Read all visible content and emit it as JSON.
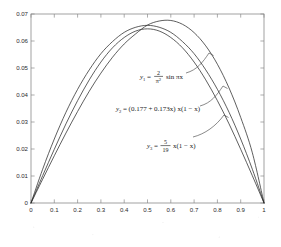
{
  "chart_data": {
    "type": "line",
    "title": "",
    "subtitle": "",
    "xlabel": "",
    "ylabel": "",
    "xlim": [
      0,
      1
    ],
    "ylim": [
      0,
      0.07
    ],
    "grid": false,
    "legend_position": "inline-annotations",
    "x_ticks": [
      "0",
      "0.1",
      "0.2",
      "0.3",
      "0.4",
      "0.5",
      "0.6",
      "0.7",
      "0.8",
      "0.9",
      "1"
    ],
    "x_tick_values": [
      0,
      0.1,
      0.2,
      0.3,
      0.4,
      0.5,
      0.6,
      0.7,
      0.8,
      0.9,
      1
    ],
    "y_ticks": [
      "0",
      "0.01",
      "0.02",
      "0.03",
      "0.04",
      "0.05",
      "0.06",
      "0.07"
    ],
    "y_tick_values": [
      0,
      0.01,
      0.02,
      0.03,
      0.04,
      0.05,
      0.06,
      0.07
    ],
    "series": [
      {
        "name": "y1",
        "formula": "y1 = (2/pi^2) sin(pi x)",
        "peak_x": 0.5,
        "peak_y": 0.0645,
        "x": [
          0,
          0.05,
          0.1,
          0.15,
          0.2,
          0.25,
          0.3,
          0.35,
          0.4,
          0.45,
          0.5,
          0.55,
          0.6,
          0.65,
          0.7,
          0.75,
          0.8,
          0.85,
          0.9,
          0.95,
          1
        ],
        "values": [
          0,
          0.0101,
          0.0199,
          0.0293,
          0.0379,
          0.0456,
          0.0522,
          0.0575,
          0.0613,
          0.0637,
          0.0645,
          0.0637,
          0.0613,
          0.0575,
          0.0522,
          0.0456,
          0.0379,
          0.0293,
          0.0199,
          0.0101,
          0
        ]
      },
      {
        "name": "y2",
        "formula": "y2 = (0.177 + 0.173x) x(1 - x)",
        "peak_x": 0.55,
        "peak_y": 0.0677,
        "x": [
          0,
          0.05,
          0.1,
          0.15,
          0.2,
          0.25,
          0.3,
          0.35,
          0.4,
          0.45,
          0.5,
          0.55,
          0.6,
          0.65,
          0.7,
          0.75,
          0.8,
          0.85,
          0.9,
          0.95,
          1
        ],
        "values": [
          0,
          0.0088,
          0.0175,
          0.0259,
          0.0339,
          0.0414,
          0.0481,
          0.054,
          0.0589,
          0.0627,
          0.0659,
          0.0674,
          0.0676,
          0.0662,
          0.0631,
          0.0582,
          0.0514,
          0.0426,
          0.0317,
          0.0186,
          0
        ]
      },
      {
        "name": "y3",
        "formula": "y3 = (5/19) x(1 - x)",
        "peak_x": 0.5,
        "peak_y": 0.0658,
        "x": [
          0,
          0.05,
          0.1,
          0.15,
          0.2,
          0.25,
          0.3,
          0.35,
          0.4,
          0.45,
          0.5,
          0.55,
          0.6,
          0.65,
          0.7,
          0.75,
          0.8,
          0.85,
          0.9,
          0.95,
          1
        ],
        "values": [
          0,
          0.0125,
          0.0237,
          0.0336,
          0.0421,
          0.0493,
          0.0553,
          0.0598,
          0.0632,
          0.0651,
          0.0658,
          0.0651,
          0.0632,
          0.0598,
          0.0553,
          0.0493,
          0.0421,
          0.0336,
          0.0237,
          0.0125,
          0
        ]
      }
    ],
    "annotations": [
      {
        "id": "annotation-y1",
        "label_var": "y",
        "label_sub": "1",
        "label_eq": "=",
        "numerator": "2",
        "denominator_base": "π",
        "denominator_exp": "2",
        "tail": "sin πx",
        "full_text": "y1 = 2/π² sin πx"
      },
      {
        "id": "annotation-y2",
        "label_var": "y",
        "label_sub": "2",
        "label_eq": "=",
        "body": "(0.177 + 0.173x) x(1 − x)",
        "full_text": "y2 = (0.177 + 0.173x) x(1 − x)"
      },
      {
        "id": "annotation-y3",
        "label_var": "y",
        "label_sub": "3",
        "label_eq": "=",
        "numerator": "5",
        "denominator": "19",
        "tail": "x(1 − x)",
        "full_text": "y3 = 5/19 x(1 − x)"
      }
    ],
    "colors": {
      "curve": "#2a2a2a",
      "axis": "#8a8a8a",
      "text": "#1a1a1a",
      "background": "#ffffff"
    }
  }
}
